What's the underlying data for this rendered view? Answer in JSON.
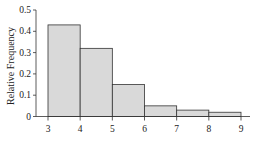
{
  "chart_data": {
    "type": "bar",
    "subtype": "histogram",
    "title": "",
    "xlabel": "",
    "ylabel": "Relative Frequency",
    "bins": [
      [
        3,
        4
      ],
      [
        4,
        5
      ],
      [
        5,
        6
      ],
      [
        6,
        7
      ],
      [
        7,
        8
      ],
      [
        8,
        9
      ]
    ],
    "categories": [
      "3-4",
      "4-5",
      "5-6",
      "6-7",
      "7-8",
      "8-9"
    ],
    "values": [
      0.43,
      0.32,
      0.15,
      0.05,
      0.03,
      0.02
    ],
    "x_ticks": [
      "3",
      "4",
      "5",
      "6",
      "7",
      "8",
      "9"
    ],
    "y_ticks": [
      "0",
      "0.1",
      "0.2",
      "0.3",
      "0.4",
      "0.5"
    ],
    "xlim": [
      3,
      9
    ],
    "ylim": [
      0,
      0.5
    ],
    "grid": false,
    "legend": null,
    "bar_fill": "#d9d9d9",
    "bar_edge": "#333333"
  }
}
